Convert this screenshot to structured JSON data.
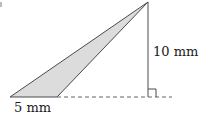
{
  "figure": {
    "type": "triangle-diagram",
    "labels": {
      "height": "10 mm",
      "base": "5 mm"
    },
    "colors": {
      "fill": "#dcdcdc",
      "stroke": "#4a4a4a",
      "dashed": "#666666"
    },
    "shapes": {
      "apex": [
        148,
        2
      ],
      "base_left": [
        10,
        97
      ],
      "base_right": [
        57,
        97
      ],
      "foot": [
        148,
        97
      ],
      "dashed_end": [
        172,
        97
      ],
      "right_angle_size": 8
    }
  }
}
